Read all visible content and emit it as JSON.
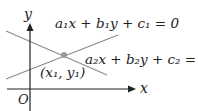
{
  "diagram": {
    "axes": {
      "x_label": "x",
      "y_label": "y",
      "origin_label": "O"
    },
    "line1": {
      "equation": "a₁x + b₁y + c₁ = 0"
    },
    "line2": {
      "equation": "a₂x + b₂y + c₂ = 0"
    },
    "intersection": {
      "label": "(x₁, y₁)"
    },
    "colors": {
      "axis": "#222222",
      "lines": "#8c8c8c",
      "point": "#999999"
    }
  }
}
